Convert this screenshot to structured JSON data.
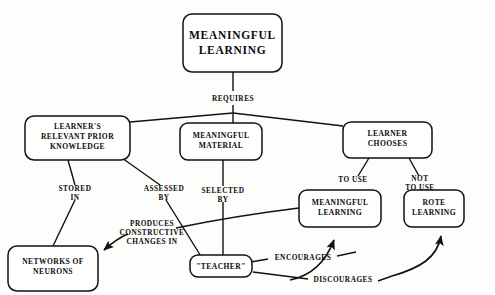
{
  "diagram": {
    "type": "concept-map",
    "nodes": [
      {
        "id": "meaningful-learning-root",
        "label_lines": [
          "MEANINGFUL",
          "LEARNING"
        ],
        "text": "MEANINGFUL LEARNING"
      },
      {
        "id": "learners-relevant-prior-knowledge",
        "label_lines": [
          "LEARNER'S",
          "RELEVANT PRIOR",
          "KNOWLEDGE"
        ],
        "text": "LEARNER'S RELEVANT PRIOR KNOWLEDGE"
      },
      {
        "id": "meaningful-material",
        "label_lines": [
          "MEANINGFUL",
          "MATERIAL"
        ],
        "text": "MEANINGFUL MATERIAL"
      },
      {
        "id": "learner-chooses",
        "label_lines": [
          "LEARNER",
          "CHOOSES"
        ],
        "text": "LEARNER CHOOSES"
      },
      {
        "id": "networks-of-neurons",
        "label_lines": [
          "NETWORKS OF",
          "NEURONS"
        ],
        "text": "NETWORKS OF NEURONS"
      },
      {
        "id": "meaningful-learning-outcome",
        "label_lines": [
          "MEANINGFUL",
          "LEARNING"
        ],
        "text": "MEANINGFUL LEARNING"
      },
      {
        "id": "rote-learning",
        "label_lines": [
          "ROTE",
          "LEARNING"
        ],
        "text": "ROTE LEARNING"
      },
      {
        "id": "teacher",
        "label_lines": [
          "\"TEACHER\""
        ],
        "text": "\"TEACHER\""
      }
    ],
    "edge_labels": {
      "requires": "REQUIRES",
      "stored_in": [
        "STORED",
        "IN"
      ],
      "assessed_by": [
        "ASSESSED",
        "BY"
      ],
      "selected_by": [
        "SELECTED",
        "BY"
      ],
      "to_use": "TO USE",
      "not_to_use": [
        "NOT",
        "TO USE"
      ],
      "produces_constructive_changes_in": [
        "PRODUCES",
        "CONSTRUCTIVE",
        "CHANGES IN"
      ],
      "encourages": "ENCOURAGES",
      "discourages": "DISCOURAGES"
    },
    "edges": [
      {
        "from": "meaningful-learning-root",
        "to": "learners-relevant-prior-knowledge",
        "label": "REQUIRES"
      },
      {
        "from": "meaningful-learning-root",
        "to": "meaningful-material",
        "label": "REQUIRES"
      },
      {
        "from": "meaningful-learning-root",
        "to": "learner-chooses",
        "label": "REQUIRES"
      },
      {
        "from": "learners-relevant-prior-knowledge",
        "to": "networks-of-neurons",
        "label": "STORED IN"
      },
      {
        "from": "learners-relevant-prior-knowledge",
        "to": "teacher",
        "label": "ASSESSED BY"
      },
      {
        "from": "meaningful-material",
        "to": "teacher",
        "label": "SELECTED BY"
      },
      {
        "from": "learner-chooses",
        "to": "meaningful-learning-outcome",
        "label": "TO USE"
      },
      {
        "from": "learner-chooses",
        "to": "rote-learning",
        "label": "NOT TO USE"
      },
      {
        "from": "meaningful-learning-outcome",
        "to": "networks-of-neurons",
        "label": "PRODUCES CONSTRUCTIVE CHANGES IN"
      },
      {
        "from": "teacher",
        "to": "meaningful-learning-outcome",
        "label": "ENCOURAGES"
      },
      {
        "from": "teacher",
        "to": "rote-learning",
        "label": "DISCOURAGES"
      }
    ],
    "colors": {
      "ink": "#111111",
      "paper": "#fdfdfb",
      "node_fill": "#ffffff"
    }
  }
}
